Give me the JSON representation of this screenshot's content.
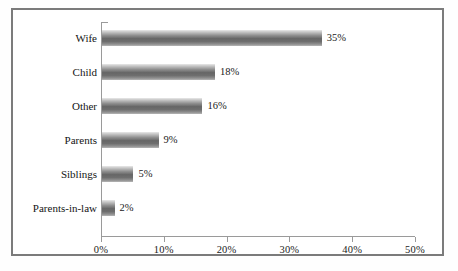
{
  "chart_data": {
    "type": "bar",
    "orientation": "horizontal",
    "title": "",
    "subtitle": "",
    "xlabel": "",
    "ylabel": "",
    "categories": [
      "Wife",
      "Child",
      "Other",
      "Parents",
      "Siblings",
      "Parents-in-law"
    ],
    "values": [
      35,
      18,
      16,
      9,
      5,
      2
    ],
    "data_labels": [
      "35%",
      "18%",
      "16%",
      "9%",
      "5%",
      "2%"
    ],
    "xlim": [
      0,
      50
    ],
    "xticks": [
      0,
      10,
      20,
      30,
      40,
      50
    ],
    "xtick_labels": [
      "0%",
      "10%",
      "20%",
      "30%",
      "40%",
      "50%"
    ],
    "grid": false,
    "legend": null,
    "legend_position": "none",
    "series": [
      {
        "name": "",
        "values": [
          35,
          18,
          16,
          9,
          5,
          2
        ]
      }
    ],
    "colors": {
      "bar_light": "#e9e9e9",
      "bar_mid": "#8f8f8f",
      "bar_dark": "#666666",
      "axis": "#9a9a9a",
      "frame": "#7b7b7b",
      "text": "#141414",
      "background": "#ffffff"
    }
  }
}
